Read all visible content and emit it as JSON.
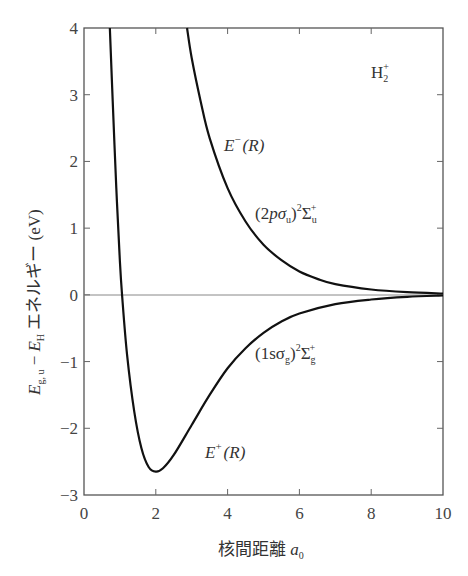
{
  "chart_data": {
    "type": "line",
    "title": "",
    "xlabel": "核間距離 a0",
    "xlabel_parts": {
      "text": "核間距離 ",
      "var": "a",
      "sub": "0"
    },
    "ylabel": "E_g,u − E_H エネルギー (eV)",
    "ylabel_parts": {
      "var1": "E",
      "sub1": "g, u",
      "minus": " − ",
      "var2": "E",
      "sub2": "H",
      "text": " エネルギー (eV)"
    },
    "xlim": [
      0,
      10
    ],
    "ylim": [
      -3,
      4
    ],
    "xticks": [
      0,
      2,
      4,
      6,
      8,
      10
    ],
    "yticks": [
      -3,
      -2,
      -1,
      0,
      1,
      2,
      3,
      4
    ],
    "grid": false,
    "zero_line": true,
    "series": [
      {
        "name": "E⁻(R)",
        "state": "(2pσu)² Σu⁺",
        "x": [
          2.87,
          3.0,
          3.25,
          3.5,
          4.0,
          4.5,
          5.0,
          5.5,
          6.0,
          6.5,
          7.0,
          8.0,
          9.0,
          10.0
        ],
        "y": [
          4.0,
          3.55,
          2.9,
          2.35,
          1.6,
          1.1,
          0.75,
          0.52,
          0.35,
          0.24,
          0.16,
          0.08,
          0.04,
          0.02
        ]
      },
      {
        "name": "E⁺(R)",
        "state": "(1sσg)² Σg⁺",
        "x": [
          0.72,
          0.8,
          0.9,
          1.0,
          1.06,
          1.2,
          1.4,
          1.6,
          1.8,
          2.0,
          2.2,
          2.5,
          3.0,
          3.5,
          4.0,
          4.5,
          5.0,
          5.5,
          6.0,
          7.0,
          8.0,
          9.0,
          10.0
        ],
        "y": [
          4.0,
          2.9,
          1.6,
          0.5,
          0.0,
          -0.9,
          -1.75,
          -2.3,
          -2.58,
          -2.65,
          -2.6,
          -2.4,
          -1.95,
          -1.5,
          -1.1,
          -0.8,
          -0.57,
          -0.4,
          -0.28,
          -0.14,
          -0.07,
          -0.03,
          -0.01
        ]
      }
    ],
    "annotations": [
      {
        "id": "molecule",
        "text": "H₂⁺",
        "x": 8.0,
        "y": 3.5
      },
      {
        "id": "eminus",
        "text": "E⁻(R)",
        "x": 4.0,
        "y": 2.05
      },
      {
        "id": "state_u",
        "text": "(2pσu)²Σu⁺",
        "x": 5.6,
        "y": 1.0
      },
      {
        "id": "state_g",
        "text": "(1sσg)²Σg⁺",
        "x": 5.6,
        "y": -0.95
      },
      {
        "id": "eplus",
        "text": "E⁺(R)",
        "x": 3.2,
        "y": -2.4
      }
    ]
  },
  "labels": {
    "xticks": [
      "0",
      "2",
      "4",
      "6",
      "8",
      "10"
    ],
    "yticks": [
      "4",
      "3",
      "2",
      "1",
      "0",
      "−1",
      "−2",
      "−3"
    ],
    "molecule": {
      "base": "H",
      "sub": "2",
      "sup": "+"
    },
    "eminus": {
      "var": "E",
      "sup": "−",
      "arg": "(R)"
    },
    "eplus": {
      "var": "E",
      "sup": "+",
      "arg": "(R)"
    },
    "state_u": {
      "open": "(2",
      "p": "p",
      "sigma": "σ",
      "sub": "u",
      "close": ")",
      "exp": "2",
      "Sigma": "Σ",
      "sym_sub": "u",
      "sym_sup": "+"
    },
    "state_g": {
      "open": "(1sσ",
      "sub": "g",
      "close": ")",
      "exp": "2",
      "Sigma": "Σ",
      "sym_sub": "g",
      "sym_sup": "+"
    },
    "xlabel": {
      "text": "核間距離 ",
      "var": "a",
      "sub": "0"
    },
    "ylabel": {
      "var1": "E",
      "sub1": "g, u",
      "minus": " − ",
      "var2": "E",
      "sub2": "H",
      "text": " エネルギー (eV)"
    }
  },
  "colors": {
    "curve": "#111111",
    "axis": "#555555",
    "zero_line": "#888888",
    "text": "#333333"
  }
}
